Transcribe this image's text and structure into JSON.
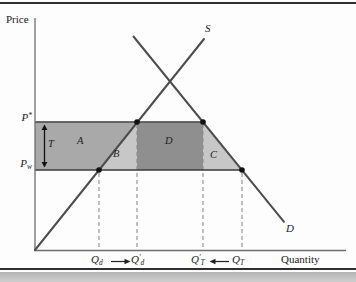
{
  "axes": {
    "y_label": "Price",
    "x_label": "Quantity"
  },
  "curves": {
    "supply_label": "S",
    "demand_label": "D"
  },
  "prices": {
    "p_star": {
      "base": "P",
      "sup": "*"
    },
    "p_w": {
      "base": "P",
      "sub": "w"
    }
  },
  "regions": {
    "tariff": "T",
    "a": "A",
    "b": "B",
    "d": "D",
    "c": "C"
  },
  "quantities": {
    "q_d": {
      "base": "Q",
      "prime": "",
      "sub": "d"
    },
    "q_d_prime": {
      "base": "Q",
      "prime": "′",
      "sub": "d"
    },
    "q_t_prime": {
      "base": "Q",
      "prime": "′",
      "sub": "T"
    },
    "q_t": {
      "base": "Q",
      "prime": "",
      "sub": "T"
    }
  },
  "colors": {
    "region_a": "#a9a9a9",
    "region_b": "#c7c7c7",
    "region_d": "#8f8f8f",
    "region_c": "#c7c7c7",
    "curve": "#4d4d4d",
    "price_line": "#3a3a3a",
    "axis": "#6e6e6e",
    "dashed": "#8c8c8c",
    "dot": "#111111"
  }
}
